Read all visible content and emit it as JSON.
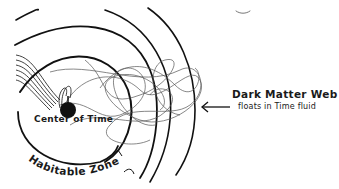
{
  "diagram": {
    "center_label": "Center of Time",
    "zone_label": "Habitable Zone",
    "callout": {
      "title": "Dark Matter Web",
      "subtitle": "floats in Time fluid"
    },
    "colors": {
      "ink": "#111111",
      "web": "#555555",
      "background": "#ffffff"
    }
  }
}
